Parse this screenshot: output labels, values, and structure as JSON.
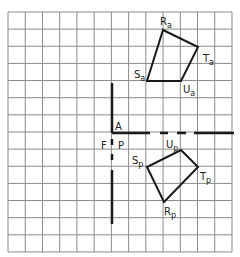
{
  "diagram": {
    "grid": {
      "x0": 8,
      "y0": 12,
      "cols": 13,
      "rows": 14,
      "cell_w": 17.23,
      "cell_h": 17.14,
      "color": "#8a8a8a"
    },
    "fold_lines": {
      "vertical": {
        "x": 112,
        "segments": [
          [
            83,
            133
          ],
          [
            139,
            145
          ],
          [
            154,
            160
          ],
          [
            170,
            224
          ]
        ]
      },
      "horizontal": {
        "y": 133,
        "segments": [
          [
            112,
            150
          ],
          [
            160,
            168
          ],
          [
            177,
            186
          ],
          [
            194,
            234
          ]
        ]
      }
    },
    "labels": {
      "A": "A",
      "F": "F",
      "P": "P"
    },
    "elevation": {
      "vertices": [
        {
          "name": "R",
          "sub": "a",
          "x": 163,
          "y": 30
        },
        {
          "name": "T",
          "sub": "a",
          "x": 198,
          "y": 47
        },
        {
          "name": "U",
          "sub": "a",
          "x": 181,
          "y": 81
        },
        {
          "name": "S",
          "sub": "a",
          "x": 147,
          "y": 81
        }
      ]
    },
    "plan": {
      "vertices": [
        {
          "name": "U",
          "sub": "p",
          "x": 181,
          "y": 150
        },
        {
          "name": "T",
          "sub": "p",
          "x": 198,
          "y": 167
        },
        {
          "name": "R",
          "sub": "p",
          "x": 164,
          "y": 202
        },
        {
          "name": "S",
          "sub": "p",
          "x": 147,
          "y": 167
        }
      ]
    },
    "line_color": "#1a1a1a"
  }
}
